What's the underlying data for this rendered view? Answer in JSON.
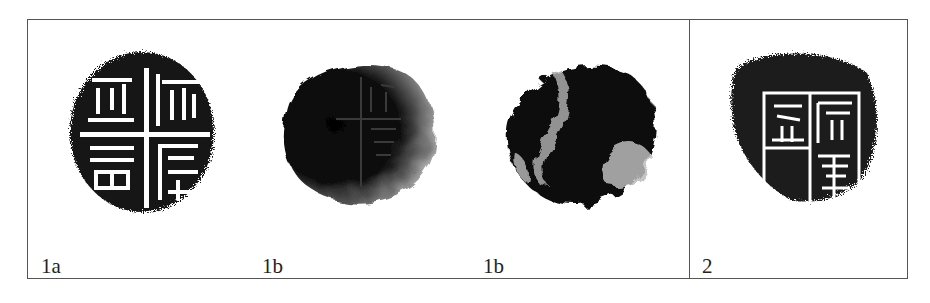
{
  "figure": {
    "panels": [
      {
        "id": "1a",
        "label": "1a",
        "kind": "seal-rubbing"
      },
      {
        "id": "1b-front",
        "label": "1b",
        "kind": "seal-photo"
      },
      {
        "id": "1b-back",
        "label": "1b",
        "kind": "seal-photo-reverse"
      },
      {
        "id": "2",
        "label": "2",
        "kind": "seal-rubbing"
      }
    ],
    "colors": {
      "frame": "#555555",
      "ink": "#111111",
      "paper": "#ffffff"
    }
  }
}
